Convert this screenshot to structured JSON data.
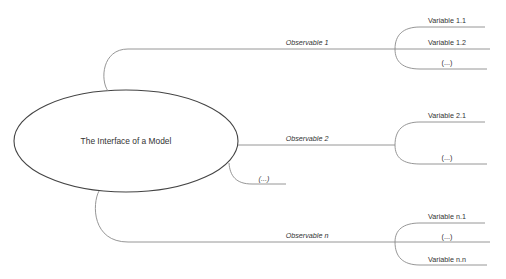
{
  "diagram": {
    "root": {
      "label": "The Interface of a Model",
      "shape": "ellipse"
    },
    "observables": [
      {
        "label": "Observable 1",
        "variables": [
          "Variable 1.1",
          "Variable 1.2",
          "(...)"
        ]
      },
      {
        "label": "Observable 2",
        "variables": [
          "Variable 2.1",
          "(...)"
        ]
      },
      {
        "label": "(...)",
        "variables": []
      },
      {
        "label": "Observable n",
        "variables": [
          "Variable n.1",
          "(...)",
          "Variable n.n"
        ]
      }
    ]
  },
  "colors": {
    "background": "#ffffff",
    "stroke": "#555555",
    "branch": "#8a8a8a",
    "text": "#333333"
  }
}
